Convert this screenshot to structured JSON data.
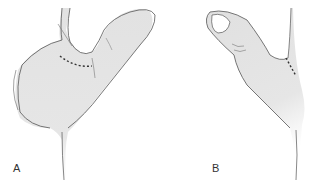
{
  "figure": {
    "panels": [
      {
        "label": "A",
        "subject": "thumb-web-dorsal-view",
        "annotation": "dotted incision line at first web space"
      },
      {
        "label": "B",
        "subject": "thumb-palmar-view",
        "annotation": "dotted incision line at thumb base"
      }
    ]
  },
  "colors": {
    "skin_fill": "#e3e3e3",
    "outline": "#555555",
    "incision": "#333333",
    "background": "#ffffff"
  }
}
